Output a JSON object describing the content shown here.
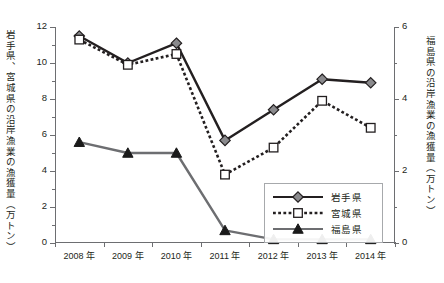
{
  "top_caption": "",
  "axis_titles": {
    "left": "岩手県、宮城県の沿岸漁業の漁獲量（万トン）",
    "right": "福島県の沿岸漁業の漁獲量（万トン）"
  },
  "legend": {
    "items": [
      {
        "label": "岩手県",
        "marker": "diamond",
        "line": "solid",
        "color": "#231f20"
      },
      {
        "label": "宮城県",
        "marker": "square",
        "line": "dotted",
        "color": "#231f20"
      },
      {
        "label": "福島県",
        "marker": "triangle",
        "line": "solid",
        "color": "#6d6e71"
      }
    ]
  },
  "chart_data": {
    "type": "line",
    "title": "",
    "xlabel": "",
    "ylabel": "岩手県、宮城県の沿岸漁業の漁獲量（万トン）",
    "y2label": "福島県の沿岸漁業の漁獲量（万トン）",
    "categories": [
      "2008 年",
      "2009 年",
      "2010 年",
      "2011 年",
      "2012 年",
      "2013 年",
      "2014 年"
    ],
    "x_tick_labels": [
      "2008 年",
      "2009 年",
      "2010 年",
      "2011 年",
      "2012 年",
      "2013 年",
      "2014 年"
    ],
    "ylim": [
      0,
      12
    ],
    "y_ticks": [
      0,
      2,
      4,
      6,
      8,
      10,
      12
    ],
    "y_minor_ticks": [
      1,
      3,
      5,
      7,
      9,
      11
    ],
    "y2lim": [
      0,
      6
    ],
    "y2_ticks": [
      0,
      2,
      4,
      6
    ],
    "y2_minor_ticks": [
      1,
      3,
      5
    ],
    "grid": false,
    "legend_position": "inside-right-lower",
    "series": [
      {
        "name": "岩手県",
        "axis": "left",
        "values": [
          11.5,
          10.0,
          11.1,
          5.7,
          7.4,
          9.1,
          8.9
        ]
      },
      {
        "name": "宮城県",
        "axis": "left",
        "values": [
          11.3,
          9.9,
          10.5,
          3.8,
          5.3,
          7.9,
          6.4
        ]
      },
      {
        "name": "福島県",
        "axis": "right",
        "values": [
          2.8,
          2.5,
          2.5,
          0.35,
          0.1,
          0.1,
          0.1
        ]
      }
    ]
  }
}
